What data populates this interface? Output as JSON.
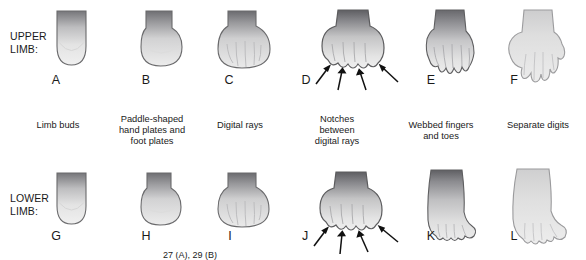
{
  "figure": {
    "rows": [
      {
        "id": "upper",
        "label": "UPPER\nLIMB:",
        "panels": [
          {
            "letter": "A",
            "shape": "limb-bud",
            "caption": "Limb buds"
          },
          {
            "letter": "B",
            "shape": "paddle-plate",
            "caption": "Paddle-shaped\nhand plates and\nfoot plates"
          },
          {
            "letter": "C",
            "shape": "digital-rays",
            "caption": "Digital rays"
          },
          {
            "letter": "D",
            "shape": "notched-rays",
            "caption": "Notches\nbetween\ndigital rays",
            "arrows": 4
          },
          {
            "letter": "E",
            "shape": "webbed-hand",
            "caption": "Webbed fingers\nand toes"
          },
          {
            "letter": "F",
            "shape": "separate-digits-hand",
            "caption": "Separate digits"
          }
        ]
      },
      {
        "id": "lower",
        "label": "LOWER\nLIMB:",
        "panels": [
          {
            "letter": "G",
            "shape": "limb-bud"
          },
          {
            "letter": "H",
            "shape": "paddle-plate"
          },
          {
            "letter": "I",
            "shape": "digital-rays"
          },
          {
            "letter": "J",
            "shape": "notched-rays",
            "arrows": 4
          },
          {
            "letter": "K",
            "shape": "webbed-foot"
          },
          {
            "letter": "L",
            "shape": "separate-digits-foot"
          }
        ]
      }
    ],
    "footnote": "27 (A), 29 (B)",
    "colors": {
      "outline": "#58585a",
      "tissue_light": "#e9e9e9",
      "tissue_mid": "#c9c9c9",
      "tissue_dark": "#6e6e70",
      "text": "#1a1a1a",
      "background": "#ffffff"
    }
  }
}
